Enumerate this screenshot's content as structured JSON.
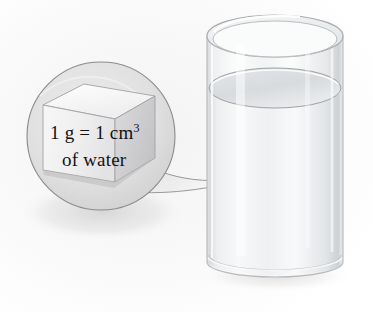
{
  "figure": {
    "name": "water-density-cube-and-beaker",
    "background_color": "#ffffff",
    "width": 373,
    "height": 312
  },
  "callout": {
    "shape": "circle-magnifier-with-tail",
    "outline_color": "#8b8b8b",
    "fill_color": "#e2e2e2",
    "label_line_1": "1 g = 1 cm",
    "label_line_1_exponent": "3",
    "label_line_2": "of water",
    "full_text": "1 g = 1 cm3 of water",
    "text_color": "#121212"
  },
  "cube": {
    "name": "unit-cube",
    "description": "one cubic centimetre cube",
    "top_face_color": "#fbfbfb",
    "front_face_color": "#efeff0",
    "right_face_color": "#d2d2d4",
    "edge_color": "#9a9a9c"
  },
  "beaker": {
    "name": "water-glass-cylinder",
    "glass_color": "#f2f3f4",
    "glass_edge_color": "#b6b8ba",
    "water_color": "#e8eaec",
    "water_surface_color": "#dcdee1",
    "rim_highlight_color": "#ffffff"
  },
  "shadow": {
    "color": "#d9d9d9"
  }
}
